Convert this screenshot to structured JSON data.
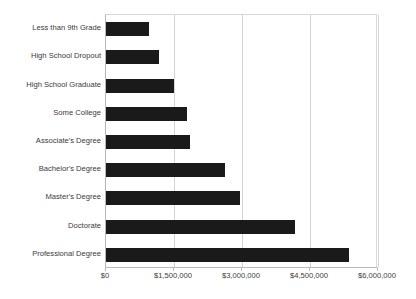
{
  "chart_data": {
    "type": "bar",
    "orientation": "horizontal",
    "title": "",
    "xlabel": "",
    "ylabel": "",
    "xlim": [
      0,
      6000000
    ],
    "grid": true,
    "legend": false,
    "bar_color": "#1a1a1a",
    "gridline_color": "#d4d4d4",
    "axis_color": "#b9b9b9",
    "categories": [
      "Less than 9th Grade",
      "High School Dropout",
      "High School Graduate",
      "Some College",
      "Associate's Degree",
      "Bachelor's Degree",
      "Master's Degree",
      "Doctorate",
      "Professional Degree"
    ],
    "values": [
      940000,
      1160000,
      1500000,
      1790000,
      1860000,
      2620000,
      2950000,
      4160000,
      5370000
    ],
    "xticks": [
      0,
      1500000,
      3000000,
      4500000,
      6000000
    ],
    "xtick_labels": [
      "$0",
      "$1,500,000",
      "$3,000,000",
      "$4,500,000",
      "$6,000,000"
    ]
  }
}
